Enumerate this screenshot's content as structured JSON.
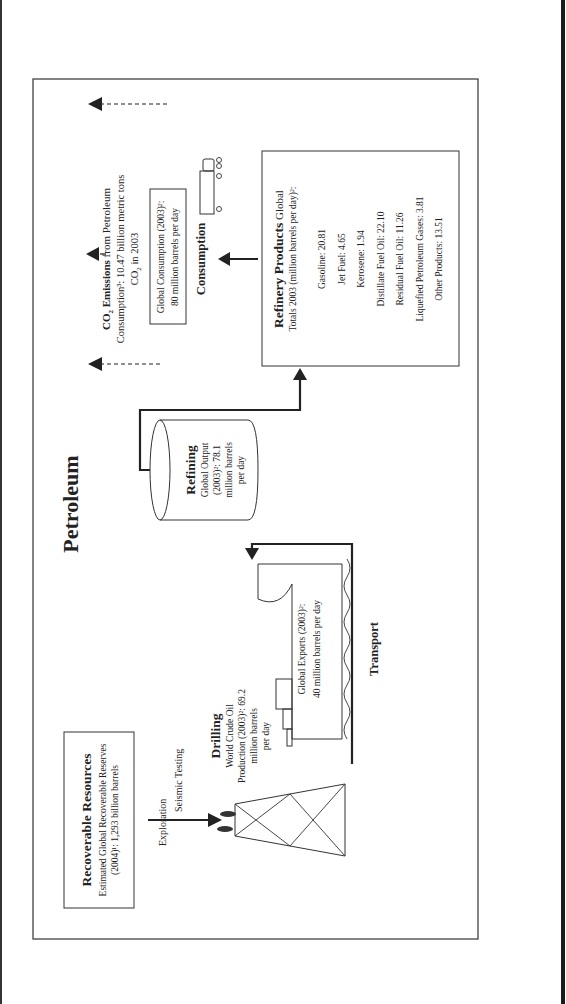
{
  "title": "Petroleum",
  "recoverable_resources": {
    "heading": "Recoverable Resources",
    "line1": "Estimated Global Recoverable Reserves",
    "line2": "(2004)¹: 1,293 billion barrels"
  },
  "exploration": {
    "label": "Exploration"
  },
  "seismic": {
    "label": "Seismic Testing"
  },
  "drilling": {
    "heading": "Drilling",
    "line1": "World Crude Oil",
    "line2": "Production (2003)²: 69.2",
    "line3": "million barrels",
    "line4": "per day"
  },
  "exports": {
    "line1": "Global Exports (2003)²:",
    "line2": "40 million barrels per day"
  },
  "transport": {
    "label": "Transport"
  },
  "refining": {
    "heading": "Refining",
    "line1": "Global Output",
    "line2": "(2003)²: 78.1",
    "line3": "million barrels",
    "line4": "per day"
  },
  "refinery_products": {
    "heading": "Refinery Products",
    "heading_suffix": " Global",
    "subheading": "Totals 2003 (million barrels per day)²:",
    "items": [
      {
        "label": "Gasoline: 20.81"
      },
      {
        "label": "Jet Fuel: 4.65"
      },
      {
        "label": "Kerosene: 1.94"
      },
      {
        "label": "Distillate Fuel Oil: 22.10"
      },
      {
        "label": "Residual Fuel Oil: 11.26"
      },
      {
        "label": "Liquefied Petroleum Gases: 3.81"
      },
      {
        "label": "Other Products: 13.51"
      }
    ]
  },
  "consumption": {
    "label": "Consumption",
    "line1": "Global Consumption (2003)²:",
    "line2": "80 million barrels per day"
  },
  "co2": {
    "heading_prefix": "CO",
    "heading_sub": "2",
    "heading_rest": " Emissions",
    "heading_tail": " from Petroleum",
    "line2": "Consumption³: 10.47 billion metric tons",
    "line3_prefix": "CO",
    "line3_sub": "2",
    "line3_rest": " in 2003"
  },
  "icons": {
    "oil_rig": "oil-rig-icon",
    "tanker_ship": "tanker-ship-icon",
    "refinery_tank": "cylinder-tank-icon",
    "truck": "truck-icon"
  },
  "colors": {
    "line": "#333333",
    "text": "#222222",
    "background": "#ffffff"
  }
}
